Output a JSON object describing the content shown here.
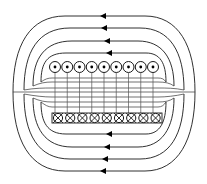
{
  "diagram": {
    "colors": {
      "line": "#1a1a1a",
      "background": "#ffffff"
    },
    "top_conductors": {
      "count": 9,
      "symbol": "dot",
      "meaning": "current out of page"
    },
    "bottom_conductors": {
      "count": 9,
      "symbol": "cross",
      "meaning": "current into page"
    },
    "outer_loops_top": 4,
    "outer_loops_bottom": 4,
    "arrow_direction": "left",
    "interior_field_lines": 7
  }
}
